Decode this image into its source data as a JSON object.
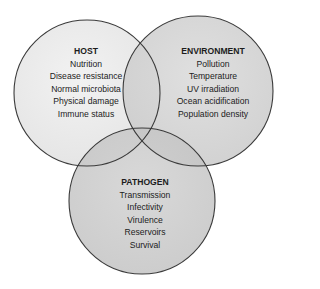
{
  "diagram": {
    "type": "venn-3",
    "colors": {
      "stroke": "#3a3a3a",
      "host_fill": "#ececec",
      "environment_fill": "#d2d2d2",
      "pathogen_fill": "#c8c8c8",
      "background": "#ffffff"
    },
    "circles": [
      {
        "id": "host",
        "title": "HOST",
        "items": [
          "Nutrition",
          "Disease resistance",
          "Normal microbiota",
          "Physical damage",
          "Immune status"
        ]
      },
      {
        "id": "environment",
        "title": "ENVIRONMENT",
        "items": [
          "Pollution",
          "Temperature",
          "UV irradiation",
          "Ocean acidification",
          "Population density"
        ]
      },
      {
        "id": "pathogen",
        "title": "PATHOGEN",
        "items": [
          "Transmission",
          "Infectivity",
          "Virulence",
          "Reservoirs",
          "Survival"
        ]
      }
    ]
  }
}
